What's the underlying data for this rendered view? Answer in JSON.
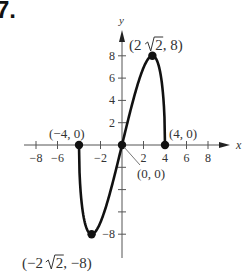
{
  "problem": {
    "number": "7."
  },
  "chart_data": {
    "type": "line",
    "title": "",
    "xlabel": "x",
    "ylabel": "y",
    "xlim": [
      -9.5,
      10
    ],
    "ylim": [
      -10,
      10.5
    ],
    "grid": false,
    "x_ticks": [
      -8,
      -6,
      -4,
      -2,
      2,
      4,
      6,
      8
    ],
    "x_tick_labels": [
      "−8",
      "−6",
      "",
      "−2",
      "2",
      "4",
      "6",
      "8"
    ],
    "y_ticks": [
      -8,
      -6,
      -4,
      -2,
      2,
      4,
      6,
      8
    ],
    "y_tick_labels": [
      "−8",
      "",
      "",
      "",
      "2",
      "4",
      "6",
      "8"
    ],
    "function": "y = x·√(16 − x²)",
    "domain": [
      -4,
      4
    ],
    "series": [
      {
        "name": "curve",
        "x": [
          -4,
          -3.9,
          -3.75,
          -3.5,
          -3.25,
          -3.0,
          -2.828,
          -2.5,
          -2.0,
          -1.5,
          -1.0,
          -0.5,
          0,
          0.5,
          1.0,
          1.5,
          2.0,
          2.5,
          2.828,
          3.0,
          3.25,
          3.5,
          3.75,
          3.9,
          4
        ],
        "y": [
          0,
          -3.47,
          -5.22,
          -6.78,
          -7.58,
          -7.94,
          -8.0,
          -7.81,
          -6.93,
          -5.56,
          -3.87,
          -1.98,
          0,
          1.98,
          3.87,
          5.56,
          6.93,
          7.81,
          8.0,
          7.94,
          7.58,
          6.78,
          5.22,
          3.47,
          0
        ]
      }
    ],
    "labeled_points": [
      {
        "x": -4,
        "y": 0,
        "label": "(−4, 0)"
      },
      {
        "x": 0,
        "y": 0,
        "label": "(0, 0)"
      },
      {
        "x": 4,
        "y": 0,
        "label": "(4, 0)"
      },
      {
        "x": 2.828,
        "y": 8,
        "label_parts": [
          "(2",
          "2, 8)"
        ],
        "label": "(2√2, 8)"
      },
      {
        "x": -2.828,
        "y": -8,
        "label_parts": [
          "(−2",
          "2, −8)"
        ],
        "label": "(−2√2, −8)"
      }
    ]
  }
}
